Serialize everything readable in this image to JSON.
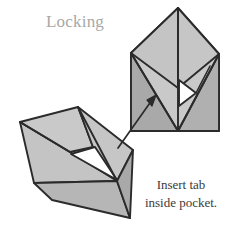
{
  "figure": {
    "title": "Locking",
    "caption": {
      "line1": "Insert tab",
      "line2": "inside pocket."
    },
    "title_color": "#a8a8a8",
    "caption_color": "#3a3a3a",
    "colors": {
      "paper_light": "#c9c9c9",
      "paper_mid": "#bdbdbd",
      "paper_dark": "#a9a9a9",
      "paper_darker": "#9d9d9d",
      "pocket_white": "#ffffff",
      "outline": "#2b2b2b",
      "background": "#ffffff"
    },
    "diagram": {
      "type": "origami-instruction",
      "step_label": "Locking",
      "shapes": [
        {
          "name": "folded-model-left",
          "description": "rotated pentagon envelope model with open pocket",
          "rotation_deg": -37
        },
        {
          "name": "folded-model-right",
          "description": "upright pentagon envelope model with open pocket",
          "rotation_deg": 0
        }
      ],
      "annotations": [
        {
          "name": "insert-arrow",
          "type": "arrow",
          "from": [
            119,
            147
          ],
          "to": [
            155,
            97
          ],
          "meaning": "insert tab into pocket"
        }
      ]
    }
  }
}
